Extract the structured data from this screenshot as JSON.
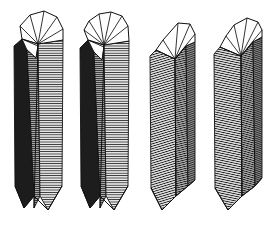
{
  "figure": {
    "background_color": "#ffffff",
    "stroke_color": "#101010",
    "width": 275,
    "height": 228,
    "object_count": 4,
    "caption": ""
  },
  "palette": {
    "outline": "#101010",
    "face_dark": "#1a1a1a",
    "face_mid_dark": "#5a5a5a",
    "face_mid": "#8c8c8c",
    "face_light": "#b8b8b8",
    "face_white": "#ffffff",
    "hatch_line": "#1c1c1c"
  },
  "objects": [
    {
      "name": "twisted-prism-1",
      "label": "1",
      "origin_x": 12,
      "origin_y": 8,
      "width": 52,
      "height": 212,
      "top_fan_segments": 6,
      "top_apex_x": 0.47,
      "top_style": "fan-triangulated",
      "band_shades": [
        "face_dark",
        "face_mid",
        "face_light"
      ],
      "hatch_orientation": "near-horizontal",
      "hatch_density": 1.0,
      "twist_direction": "right",
      "twist_amount": 0.16
    },
    {
      "name": "twisted-prism-2",
      "label": "2",
      "origin_x": 78,
      "origin_y": 8,
      "width": 52,
      "height": 212,
      "top_fan_segments": 8,
      "top_apex_x": 0.44,
      "top_style": "fan-triangulated",
      "band_shades": [
        "face_dark",
        "face_mid",
        "face_light"
      ],
      "hatch_orientation": "near-horizontal",
      "hatch_density": 1.0,
      "twist_direction": "right",
      "twist_amount": 0.2
    },
    {
      "name": "twisted-prism-3",
      "label": "3",
      "origin_x": 149,
      "origin_y": 14,
      "width": 47,
      "height": 204,
      "top_fan_segments": 4,
      "top_apex_x": 0.52,
      "top_style": "fan-triangulated",
      "band_shades": [
        "face_light",
        "face_mid",
        "face_mid_dark"
      ],
      "hatch_orientation": "diagonal-up",
      "hatch_density": 0.9,
      "twist_direction": "left",
      "twist_amount": 0.26
    },
    {
      "name": "twisted-prism-4",
      "label": "4",
      "origin_x": 213,
      "origin_y": 12,
      "width": 49,
      "height": 206,
      "top_fan_segments": 7,
      "top_apex_x": 0.41,
      "top_style": "fan-triangulated",
      "band_shades": [
        "face_light",
        "face_mid",
        "face_mid_dark"
      ],
      "hatch_orientation": "diagonal-up",
      "hatch_density": 0.95,
      "twist_direction": "left",
      "twist_amount": 0.3
    }
  ]
}
